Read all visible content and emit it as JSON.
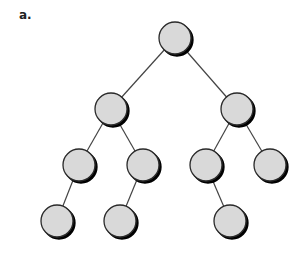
{
  "figure": {
    "label": "a.",
    "node_fill": "#d9d9d9",
    "node_stroke": "#2a2a2a",
    "edge_color": "#444444",
    "node_radius": 16
  },
  "tree": {
    "nodes": [
      {
        "id": "n0",
        "x": 175,
        "y": 38
      },
      {
        "id": "n1",
        "x": 111,
        "y": 109
      },
      {
        "id": "n2",
        "x": 237,
        "y": 109
      },
      {
        "id": "n3",
        "x": 79,
        "y": 165
      },
      {
        "id": "n4",
        "x": 143,
        "y": 165
      },
      {
        "id": "n5",
        "x": 206,
        "y": 165
      },
      {
        "id": "n6",
        "x": 270,
        "y": 165
      },
      {
        "id": "n7",
        "x": 57,
        "y": 221
      },
      {
        "id": "n8",
        "x": 120,
        "y": 221
      },
      {
        "id": "n9",
        "x": 230,
        "y": 221
      }
    ],
    "edges": [
      [
        "n0",
        "n1"
      ],
      [
        "n0",
        "n2"
      ],
      [
        "n1",
        "n3"
      ],
      [
        "n1",
        "n4"
      ],
      [
        "n2",
        "n5"
      ],
      [
        "n2",
        "n6"
      ],
      [
        "n3",
        "n7"
      ],
      [
        "n4",
        "n8"
      ],
      [
        "n5",
        "n9"
      ]
    ]
  }
}
